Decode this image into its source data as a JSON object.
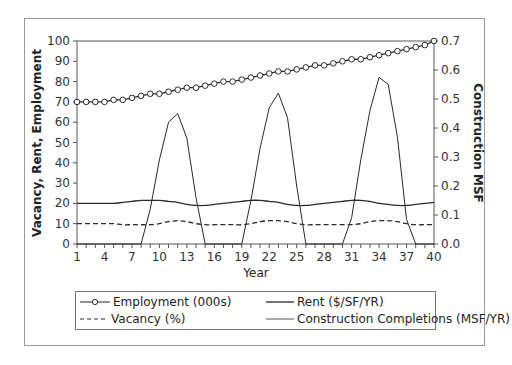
{
  "chart_data": {
    "type": "line",
    "title": "",
    "xlabel": "Year",
    "ylabel": "Vacancy, Rent, Employment",
    "y2label": "Construction MSF",
    "ylim": [
      0,
      100
    ],
    "y2lim": [
      0.0,
      0.7
    ],
    "xlim": [
      1,
      40
    ],
    "x_ticks": [
      1,
      4,
      7,
      10,
      13,
      16,
      19,
      22,
      25,
      28,
      31,
      34,
      37,
      40
    ],
    "y_ticks": [
      0,
      10,
      20,
      30,
      40,
      50,
      60,
      70,
      80,
      90,
      100
    ],
    "y2_ticks": [
      "0.0",
      "0.1",
      "0.2",
      "0.3",
      "0.4",
      "0.5",
      "0.6",
      "0.7"
    ],
    "grid": false,
    "legend_position": "bottom",
    "x": [
      1,
      2,
      3,
      4,
      5,
      6,
      7,
      8,
      9,
      10,
      11,
      12,
      13,
      14,
      15,
      16,
      17,
      18,
      19,
      20,
      21,
      22,
      23,
      24,
      25,
      26,
      27,
      28,
      29,
      30,
      31,
      32,
      33,
      34,
      35,
      36,
      37,
      38,
      39,
      40
    ],
    "series": [
      {
        "name": "Employment (000s)",
        "axis": "left",
        "style": "line-circle",
        "values": [
          70,
          70,
          70,
          70,
          71,
          71,
          72,
          73,
          74,
          74,
          75,
          76,
          77,
          77,
          78,
          79,
          80,
          80,
          81,
          82,
          83,
          84,
          85,
          85,
          86,
          87,
          88,
          88,
          89,
          90,
          91,
          91,
          92,
          93,
          94,
          95,
          96,
          97,
          98,
          100
        ]
      },
      {
        "name": "Rent ($/SF/YR)",
        "axis": "left",
        "style": "solid",
        "values": [
          20,
          20,
          20,
          20,
          20,
          20.5,
          21,
          21.5,
          21.5,
          21.5,
          21,
          20.5,
          19.5,
          19,
          19,
          19.5,
          20,
          20.5,
          21,
          21.5,
          21.5,
          21,
          20.5,
          19.5,
          19,
          19,
          19.5,
          20,
          20.5,
          21,
          21.5,
          21.5,
          21,
          20,
          19.5,
          19,
          19,
          19.5,
          20,
          20.5
        ]
      },
      {
        "name": "Vacancy (%)",
        "axis": "left",
        "style": "dashed",
        "values": [
          10,
          10,
          10,
          10,
          10,
          9.5,
          9.5,
          9.5,
          9.5,
          10,
          11,
          11.5,
          11,
          10,
          9.5,
          9.5,
          9.5,
          9.5,
          9.5,
          10,
          11,
          11.5,
          11.5,
          11,
          10,
          9.5,
          9.5,
          9.5,
          9.5,
          9.5,
          9.5,
          10,
          11,
          11.5,
          11.5,
          11,
          10,
          9.5,
          9.5,
          9.5
        ]
      },
      {
        "name": "Construction Completions (MSF/YR)",
        "axis": "right",
        "style": "solid-thin",
        "values": [
          0,
          0,
          0,
          0,
          0,
          0,
          0,
          0,
          0.12,
          0.29,
          0.42,
          0.45,
          0.365,
          0.16,
          0,
          0,
          0,
          0,
          0,
          0.15,
          0.33,
          0.47,
          0.52,
          0.435,
          0.2,
          0,
          0,
          0,
          0,
          0,
          0.09,
          0.29,
          0.46,
          0.575,
          0.55,
          0.37,
          0.085,
          0,
          0,
          0
        ]
      }
    ]
  },
  "legend": {
    "items": [
      {
        "label": "Employment (000s)",
        "style": "line-circle"
      },
      {
        "label": "Rent ($/SF/YR)",
        "style": "solid"
      },
      {
        "label": "Vacancy (%)",
        "style": "dashed"
      },
      {
        "label": "Construction Completions (MSF/YR)",
        "style": "solid-thin"
      }
    ]
  },
  "colors": {
    "line": "#2a2a2a",
    "frame": "#9a9a9a"
  }
}
